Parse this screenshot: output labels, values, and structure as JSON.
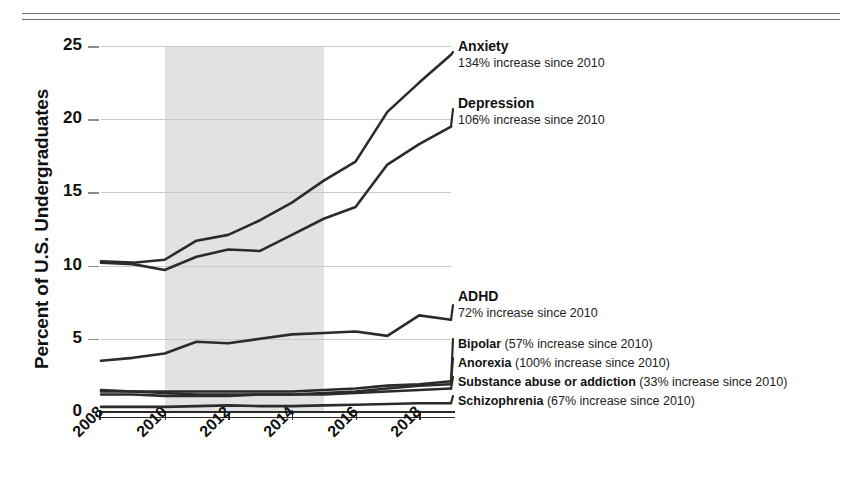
{
  "chart_data": {
    "type": "line",
    "title": "",
    "xlabel": "",
    "ylabel": "Percent of U.S. Undergraduates",
    "x": [
      2008,
      2009,
      2010,
      2011,
      2012,
      2013,
      2014,
      2015,
      2016,
      2017,
      2018,
      2019
    ],
    "xlim": [
      2008,
      2019
    ],
    "ylim": [
      0,
      25
    ],
    "yticks": [
      0,
      5,
      10,
      15,
      20,
      25
    ],
    "xticks": [
      2008,
      2010,
      2012,
      2014,
      2016,
      2018
    ],
    "grid": true,
    "legend_position": "right-inline-labels",
    "shaded_region": {
      "from": 2010,
      "to": 2015,
      "color": "#e2e2e2"
    },
    "series": [
      {
        "name": "Anxiety",
        "annotation": "134% increase since 2010",
        "values": [
          10.3,
          10.2,
          10.4,
          11.7,
          12.1,
          13.1,
          14.3,
          15.8,
          17.1,
          20.5,
          22.5,
          24.4
        ]
      },
      {
        "name": "Depression",
        "annotation": "106% increase since 2010",
        "values": [
          10.2,
          10.1,
          9.7,
          10.6,
          11.1,
          11.0,
          12.1,
          13.2,
          14.0,
          16.9,
          18.3,
          19.5
        ]
      },
      {
        "name": "ADHD",
        "annotation": "72% increase since 2010",
        "values": [
          3.5,
          3.7,
          4.0,
          4.8,
          4.7,
          5.0,
          5.3,
          5.4,
          5.5,
          5.2,
          6.6,
          6.3
        ]
      },
      {
        "name": "Bipolar",
        "annotation": "57% increase since 2010",
        "values": [
          1.4,
          1.4,
          1.4,
          1.4,
          1.4,
          1.4,
          1.4,
          1.5,
          1.6,
          1.8,
          1.9,
          2.1
        ]
      },
      {
        "name": "Anorexia",
        "annotation": "100% increase since 2010",
        "values": [
          1.2,
          1.2,
          1.1,
          1.1,
          1.1,
          1.2,
          1.2,
          1.3,
          1.4,
          1.6,
          1.8,
          1.9
        ]
      },
      {
        "name": "Substance abuse or addiction",
        "annotation": "33% increase since 2010",
        "values": [
          1.5,
          1.4,
          1.3,
          1.2,
          1.2,
          1.2,
          1.2,
          1.2,
          1.3,
          1.4,
          1.5,
          1.6
        ]
      },
      {
        "name": "Schizophrenia",
        "annotation": "67% increase since 2010",
        "values": [
          0.35,
          0.35,
          0.35,
          0.4,
          0.45,
          0.4,
          0.4,
          0.45,
          0.5,
          0.55,
          0.6,
          0.6
        ]
      }
    ]
  },
  "axis": {
    "y_title": "Percent of U.S. Undergraduates",
    "y_ticks": [
      "25",
      "20",
      "15",
      "10",
      "5",
      "0"
    ],
    "x_ticks": [
      "2008",
      "2010",
      "2012",
      "2014",
      "2016",
      "2018"
    ]
  },
  "annotations": {
    "anxiety": {
      "title": "Anxiety",
      "sub": "134% increase since 2010"
    },
    "depression": {
      "title": "Depression",
      "sub": "106% increase since 2010"
    },
    "adhd": {
      "title": "ADHD",
      "sub": "72% increase since 2010"
    },
    "bipolar": {
      "name": "Bipolar",
      "detail": "(57% increase since 2010)"
    },
    "anorexia": {
      "name": "Anorexia",
      "detail": "(100% increase since 2010)"
    },
    "substance": {
      "name": "Substance abuse or addiction",
      "detail": "(33% increase since 2010)"
    },
    "schizophrenia": {
      "name": "Schizophrenia",
      "detail": "(67% increase since 2010)"
    }
  },
  "colors": {
    "line": "#2b2b2b",
    "band": "#e2e2e2",
    "grid": "#c9c9c9",
    "text": "#111111"
  }
}
